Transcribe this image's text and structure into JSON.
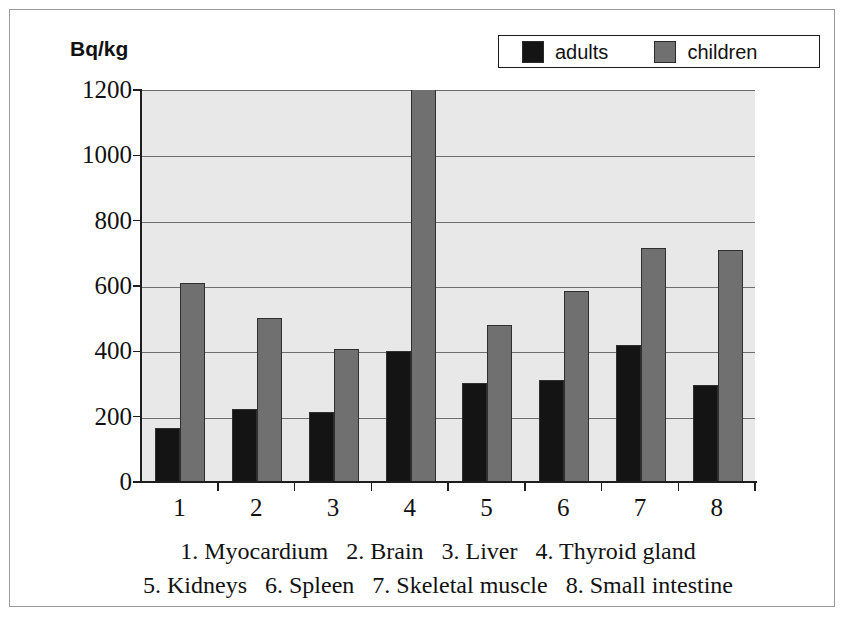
{
  "figure": {
    "unit_label": "Bq/kg",
    "frame_border_color": "#9a9a9a",
    "plot_background": "#e8e8e8",
    "canvas_background": "#ffffff"
  },
  "legend": {
    "position": "top-right",
    "entries": [
      {
        "label": "adults",
        "color": "#141414",
        "swatch_name": "legend-swatch-adults"
      },
      {
        "label": "children",
        "color": "#707070",
        "swatch_name": "legend-swatch-children"
      }
    ]
  },
  "caption": {
    "line1": "1. Myocardium   2. Brain   3. Liver   4. Thyroid gland",
    "line2": "5. Kidneys   6. Spleen   7. Skeletal muscle   8. Small intestine"
  },
  "chart_data": {
    "type": "bar",
    "title": "",
    "xlabel": "",
    "ylabel": "Bq/kg",
    "ylim": [
      0,
      1200
    ],
    "ytick_values": [
      0,
      200,
      400,
      600,
      800,
      1000,
      1200
    ],
    "ytick_labels": [
      "0",
      "200",
      "400",
      "600",
      "800",
      "1000",
      "1200"
    ],
    "categories": [
      "1",
      "2",
      "3",
      "4",
      "5",
      "6",
      "7",
      "8"
    ],
    "category_names": [
      "Myocardium",
      "Brain",
      "Liver",
      "Thyroid gland",
      "Kidneys",
      "Spleen",
      "Skeletal muscle",
      "Small intestine"
    ],
    "grid": true,
    "grid_axis": "y",
    "legend_position": "top-right",
    "series": [
      {
        "name": "adults",
        "color": "#141414",
        "values": [
          165,
          222,
          215,
          400,
          303,
          312,
          418,
          298
        ]
      },
      {
        "name": "children",
        "color": "#707070",
        "values": [
          610,
          503,
          408,
          1200,
          480,
          585,
          715,
          710
        ]
      }
    ]
  }
}
